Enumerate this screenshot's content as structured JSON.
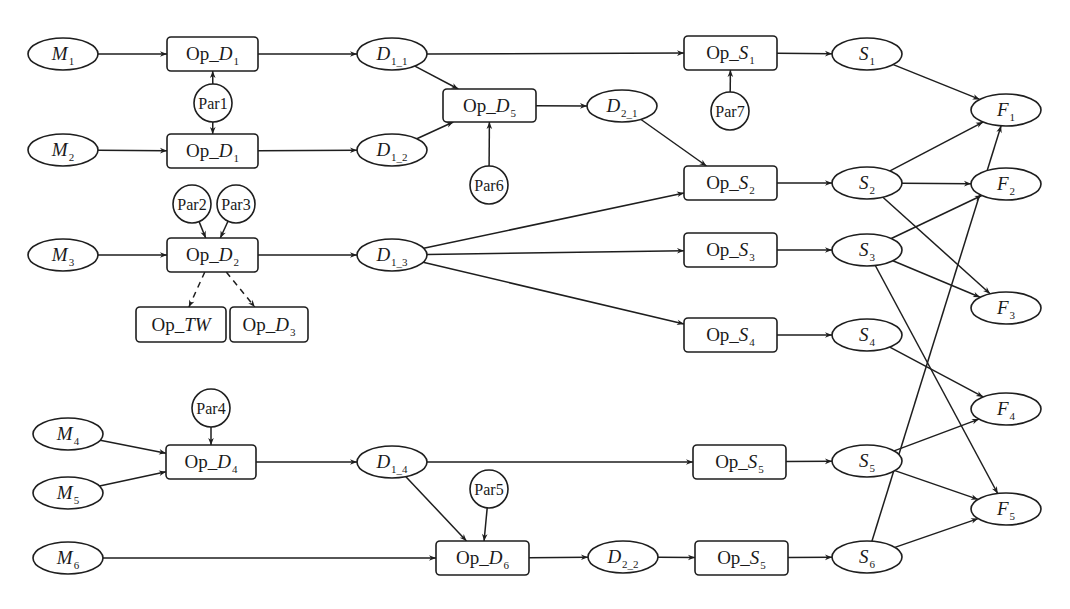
{
  "diagram": {
    "type": "process-flow",
    "nodes": [
      {
        "id": "M1",
        "shape": "ellipse",
        "main": "M",
        "sub": "1",
        "italic": true,
        "cx": 63,
        "cy": 54
      },
      {
        "id": "M2",
        "shape": "ellipse",
        "main": "M",
        "sub": "2",
        "italic": true,
        "cx": 63,
        "cy": 150
      },
      {
        "id": "M3",
        "shape": "ellipse",
        "main": "M",
        "sub": "3",
        "italic": true,
        "cx": 63,
        "cy": 255
      },
      {
        "id": "M4",
        "shape": "ellipse",
        "main": "M",
        "sub": "4",
        "italic": true,
        "cx": 68,
        "cy": 434
      },
      {
        "id": "M5",
        "shape": "ellipse",
        "main": "M",
        "sub": "5",
        "italic": true,
        "cx": 68,
        "cy": 493
      },
      {
        "id": "M6",
        "shape": "ellipse",
        "main": "M",
        "sub": "6",
        "italic": true,
        "cx": 68,
        "cy": 558
      },
      {
        "id": "OpD1a",
        "shape": "box",
        "prefix": "Op_",
        "main": "D",
        "sub": "1",
        "x": 167,
        "y": 37,
        "w": 91,
        "h": 34
      },
      {
        "id": "OpD1b",
        "shape": "box",
        "prefix": "Op_",
        "main": "D",
        "sub": "1",
        "x": 167,
        "y": 134,
        "w": 91,
        "h": 34
      },
      {
        "id": "OpD2",
        "shape": "box",
        "prefix": "Op_",
        "main": "D",
        "sub": "2",
        "x": 167,
        "y": 238,
        "w": 91,
        "h": 34
      },
      {
        "id": "OpTW",
        "shape": "box",
        "prefix": "Op_",
        "main": "TW",
        "sub": "",
        "x": 136,
        "y": 307,
        "w": 90,
        "h": 35
      },
      {
        "id": "OpD3",
        "shape": "box",
        "prefix": "Op_",
        "main": "D",
        "sub": "3",
        "x": 230,
        "y": 307,
        "w": 78,
        "h": 35
      },
      {
        "id": "OpD4",
        "shape": "box",
        "prefix": "Op_",
        "main": "D",
        "sub": "4",
        "x": 166,
        "y": 445,
        "w": 90,
        "h": 34
      },
      {
        "id": "OpD5",
        "shape": "box",
        "prefix": "Op_",
        "main": "D",
        "sub": "5",
        "x": 443,
        "y": 89,
        "w": 93,
        "h": 33
      },
      {
        "id": "OpD6",
        "shape": "box",
        "prefix": "Op_",
        "main": "D",
        "sub": "6",
        "x": 436,
        "y": 541,
        "w": 93,
        "h": 34
      },
      {
        "id": "D1_1",
        "shape": "ellipse",
        "main": "D",
        "sub": "1_1",
        "italic": true,
        "cx": 392,
        "cy": 54
      },
      {
        "id": "D1_2",
        "shape": "ellipse",
        "main": "D",
        "sub": "1_2",
        "italic": true,
        "cx": 392,
        "cy": 150
      },
      {
        "id": "D1_3",
        "shape": "ellipse",
        "main": "D",
        "sub": "1_3",
        "italic": true,
        "cx": 392,
        "cy": 255
      },
      {
        "id": "D1_4",
        "shape": "ellipse",
        "main": "D",
        "sub": "1_4",
        "italic": true,
        "cx": 392,
        "cy": 462
      },
      {
        "id": "D2_1",
        "shape": "ellipse",
        "main": "D",
        "sub": "2_1",
        "italic": true,
        "cx": 622,
        "cy": 106
      },
      {
        "id": "D2_2",
        "shape": "ellipse",
        "main": "D",
        "sub": "2_2",
        "italic": true,
        "cx": 623,
        "cy": 557
      },
      {
        "id": "OpS1",
        "shape": "box",
        "prefix": "Op_",
        "main": "S",
        "sub": "1",
        "x": 684,
        "y": 36,
        "w": 93,
        "h": 34
      },
      {
        "id": "OpS2",
        "shape": "box",
        "prefix": "Op_",
        "main": "S",
        "sub": "2",
        "x": 684,
        "y": 166,
        "w": 93,
        "h": 34
      },
      {
        "id": "OpS3",
        "shape": "box",
        "prefix": "Op_",
        "main": "S",
        "sub": "3",
        "x": 684,
        "y": 233,
        "w": 93,
        "h": 34
      },
      {
        "id": "OpS4",
        "shape": "box",
        "prefix": "Op_",
        "main": "S",
        "sub": "4",
        "x": 684,
        "y": 318,
        "w": 93,
        "h": 34
      },
      {
        "id": "OpS5a",
        "shape": "box",
        "prefix": "Op_",
        "main": "S",
        "sub": "5",
        "x": 693,
        "y": 445,
        "w": 93,
        "h": 34
      },
      {
        "id": "OpS5b",
        "shape": "box",
        "prefix": "Op_",
        "main": "S",
        "sub": "5",
        "x": 695,
        "y": 541,
        "w": 93,
        "h": 34
      },
      {
        "id": "S1",
        "shape": "ellipse",
        "main": "S",
        "sub": "1",
        "italic": true,
        "cx": 867,
        "cy": 54
      },
      {
        "id": "S2",
        "shape": "ellipse",
        "main": "S",
        "sub": "2",
        "italic": true,
        "cx": 867,
        "cy": 183
      },
      {
        "id": "S3",
        "shape": "ellipse",
        "main": "S",
        "sub": "3",
        "italic": true,
        "cx": 867,
        "cy": 250
      },
      {
        "id": "S4",
        "shape": "ellipse",
        "main": "S",
        "sub": "4",
        "italic": true,
        "cx": 867,
        "cy": 335
      },
      {
        "id": "S5",
        "shape": "ellipse",
        "main": "S",
        "sub": "5",
        "italic": true,
        "cx": 867,
        "cy": 461
      },
      {
        "id": "S6",
        "shape": "ellipse",
        "main": "S",
        "sub": "6",
        "italic": true,
        "cx": 867,
        "cy": 557
      },
      {
        "id": "F1",
        "shape": "ellipse",
        "main": "F",
        "sub": "1",
        "italic": true,
        "cx": 1006,
        "cy": 110
      },
      {
        "id": "F2",
        "shape": "ellipse",
        "main": "F",
        "sub": "2",
        "italic": true,
        "cx": 1006,
        "cy": 184
      },
      {
        "id": "F3",
        "shape": "ellipse",
        "main": "F",
        "sub": "3",
        "italic": true,
        "cx": 1006,
        "cy": 308
      },
      {
        "id": "F4",
        "shape": "ellipse",
        "main": "F",
        "sub": "4",
        "italic": true,
        "cx": 1006,
        "cy": 409
      },
      {
        "id": "F5",
        "shape": "ellipse",
        "main": "F",
        "sub": "5",
        "italic": true,
        "cx": 1006,
        "cy": 509
      },
      {
        "id": "Par1",
        "shape": "circle",
        "main": "Par1",
        "cx": 213,
        "cy": 103
      },
      {
        "id": "Par2",
        "shape": "circle",
        "main": "Par2",
        "cx": 192,
        "cy": 204
      },
      {
        "id": "Par3",
        "shape": "circle",
        "main": "Par3",
        "cx": 236,
        "cy": 204
      },
      {
        "id": "Par4",
        "shape": "circle",
        "main": "Par4",
        "cx": 211,
        "cy": 408
      },
      {
        "id": "Par5",
        "shape": "circle",
        "main": "Par5",
        "cx": 489,
        "cy": 489
      },
      {
        "id": "Par6",
        "shape": "circle",
        "main": "Par6",
        "cx": 489,
        "cy": 185
      },
      {
        "id": "Par7",
        "shape": "circle",
        "main": "Par7",
        "cx": 730,
        "cy": 111
      }
    ],
    "edges": [
      {
        "from": "M1",
        "to": "OpD1a"
      },
      {
        "from": "M2",
        "to": "OpD1b"
      },
      {
        "from": "M3",
        "to": "OpD2"
      },
      {
        "from": "M4",
        "to": "OpD4"
      },
      {
        "from": "M5",
        "to": "OpD4"
      },
      {
        "from": "M6",
        "to": "OpD6"
      },
      {
        "from": "Par1",
        "to": "OpD1a"
      },
      {
        "from": "Par1",
        "to": "OpD1b"
      },
      {
        "from": "Par2",
        "to": "OpD2"
      },
      {
        "from": "Par3",
        "to": "OpD2"
      },
      {
        "from": "Par4",
        "to": "OpD4"
      },
      {
        "from": "Par5",
        "to": "OpD6"
      },
      {
        "from": "Par6",
        "to": "OpD5"
      },
      {
        "from": "Par7",
        "to": "OpS1"
      },
      {
        "from": "OpD2",
        "to": "OpTW",
        "style": "dashed"
      },
      {
        "from": "OpD2",
        "to": "OpD3",
        "style": "dashed"
      },
      {
        "from": "OpD1a",
        "to": "D1_1"
      },
      {
        "from": "OpD1b",
        "to": "D1_2"
      },
      {
        "from": "OpD2",
        "to": "D1_3"
      },
      {
        "from": "OpD4",
        "to": "D1_4"
      },
      {
        "from": "D1_1",
        "to": "OpS1"
      },
      {
        "from": "D1_1",
        "to": "OpD5"
      },
      {
        "from": "D1_2",
        "to": "OpD5"
      },
      {
        "from": "OpD5",
        "to": "D2_1"
      },
      {
        "from": "D2_1",
        "to": "OpS2"
      },
      {
        "from": "D1_3",
        "to": "OpS2"
      },
      {
        "from": "D1_3",
        "to": "OpS3"
      },
      {
        "from": "D1_3",
        "to": "OpS4"
      },
      {
        "from": "D1_4",
        "to": "OpS5a"
      },
      {
        "from": "D1_4",
        "to": "OpD6"
      },
      {
        "from": "OpD6",
        "to": "D2_2"
      },
      {
        "from": "D2_2",
        "to": "OpS5b"
      },
      {
        "from": "OpS1",
        "to": "S1"
      },
      {
        "from": "OpS2",
        "to": "S2"
      },
      {
        "from": "OpS3",
        "to": "S3"
      },
      {
        "from": "OpS4",
        "to": "S4"
      },
      {
        "from": "OpS5a",
        "to": "S5"
      },
      {
        "from": "OpS5b",
        "to": "S6"
      },
      {
        "from": "S1",
        "to": "F1"
      },
      {
        "from": "S2",
        "to": "F1"
      },
      {
        "from": "S2",
        "to": "F2"
      },
      {
        "from": "S2",
        "to": "F3"
      },
      {
        "from": "S3",
        "to": "F2"
      },
      {
        "from": "S3",
        "to": "F3"
      },
      {
        "from": "S3",
        "to": "F5"
      },
      {
        "from": "S4",
        "to": "F4"
      },
      {
        "from": "S5",
        "to": "F4"
      },
      {
        "from": "S5",
        "to": "F5"
      },
      {
        "from": "S6",
        "to": "F1"
      },
      {
        "from": "S6",
        "to": "F5"
      }
    ]
  },
  "style": {
    "stroke": "#1e1e1e",
    "fill": "#ffffff",
    "ellipse_rx": 35,
    "ellipse_ry": 16,
    "circle_r": 19,
    "box_radius": 4
  }
}
